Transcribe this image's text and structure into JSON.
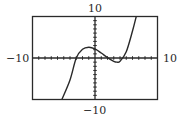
{
  "chart_data": {
    "type": "line",
    "title": "",
    "xlabel": "",
    "ylabel": "",
    "xlim": [
      -10,
      10
    ],
    "ylim": [
      -10,
      10
    ],
    "x_tick_step": 1,
    "y_tick_step": 1,
    "grid": false,
    "window_labels": {
      "xmin": "−10",
      "xmax": "10",
      "ymin": "−10",
      "ymax": "10"
    },
    "series": [
      {
        "name": "cubic",
        "description": "cubic with root near x=-3, local max near (-1, 2.6), local min near (3.5, -1)",
        "x": [
          -5.3,
          -4,
          -3,
          -2,
          -1,
          0,
          1,
          2,
          3,
          3.5,
          4,
          5,
          6,
          6.6
        ],
        "y": [
          -10,
          -5.3,
          0,
          2.1,
          2.6,
          2.2,
          1.2,
          0.1,
          -0.8,
          -1,
          -0.8,
          1.5,
          6.5,
          10
        ]
      }
    ]
  },
  "colors": {
    "axis": "#2a2a2a",
    "curve": "#2a2a2a",
    "frame": "#2a2a2a"
  }
}
